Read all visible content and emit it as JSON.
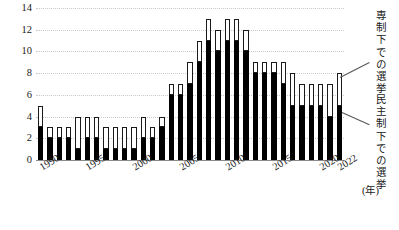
{
  "chart_data": {
    "type": "bar",
    "subtype": "stacked-bar",
    "title": "",
    "xlabel": "年",
    "ylabel": "",
    "ylim": [
      0,
      14
    ],
    "ytick_step": 2,
    "yticks": [
      0,
      2,
      4,
      6,
      8,
      10,
      12,
      14
    ],
    "grid": true,
    "legend_position": "right-annotations",
    "categories": [
      "1990",
      "1991",
      "1992",
      "1993",
      "1994",
      "1995",
      "1996",
      "1997",
      "1998",
      "1999",
      "2000",
      "2001",
      "2002",
      "2003",
      "2004",
      "2005",
      "2006",
      "2007",
      "2008",
      "2009",
      "2010",
      "2011",
      "2012",
      "2013",
      "2014",
      "2015",
      "2016",
      "2017",
      "2018",
      "2019",
      "2020",
      "2021",
      "2022"
    ],
    "series": [
      {
        "name": "民主制下での選挙",
        "color": "#000000",
        "values": [
          3,
          2,
          2,
          2,
          1,
          2,
          2,
          1,
          1,
          1,
          1,
          2,
          2,
          3,
          6,
          6,
          7,
          9,
          11,
          10,
          11,
          11,
          10,
          8,
          8,
          8,
          7,
          5,
          5,
          5,
          5,
          4,
          5
        ]
      },
      {
        "name": "専制下での選挙",
        "color": "#ffffff",
        "values": [
          2,
          1,
          1,
          1,
          3,
          2,
          2,
          2,
          2,
          2,
          2,
          2,
          1,
          1,
          1,
          1,
          2,
          2,
          2,
          2,
          2,
          2,
          2,
          1,
          1,
          1,
          2,
          3,
          2,
          2,
          2,
          3,
          3
        ]
      }
    ],
    "totals": [
      5,
      3,
      3,
      3,
      4,
      4,
      4,
      3,
      3,
      3,
      3,
      4,
      3,
      4,
      7,
      7,
      9,
      11,
      13,
      12,
      13,
      13,
      12,
      9,
      9,
      9,
      9,
      8,
      7,
      7,
      7,
      7,
      8
    ],
    "xtick_labels": [
      "1990",
      "1995",
      "2000",
      "2005",
      "2010",
      "2015",
      "2020",
      "2022"
    ],
    "xtick_categories": [
      "1990",
      "1995",
      "2000",
      "2005",
      "2010",
      "2015",
      "2020",
      "2022"
    ],
    "x_unit_label": "(年)",
    "annotations": [
      {
        "name": "autocracy-label",
        "text": "専制下での選挙",
        "points_to": "white-segment"
      },
      {
        "name": "democracy-label",
        "text": "民主制下での選挙",
        "points_to": "black-segment"
      }
    ]
  }
}
